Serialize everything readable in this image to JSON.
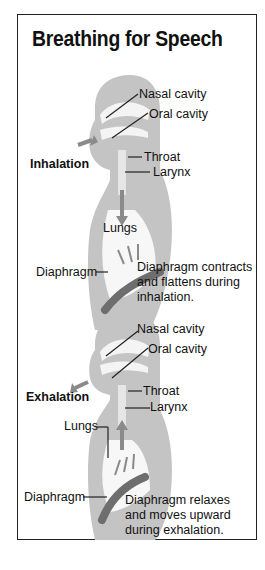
{
  "title": "Breathing for Speech",
  "colors": {
    "body": "#c4c4c4",
    "cavity": "#f4f4f4",
    "diaphragm": "#6e6e6e",
    "arrow": "#8a8a8a",
    "border": "#222222"
  },
  "inhalation": {
    "phase_label": "Inhalation",
    "labels": {
      "nasal": "Nasal cavity",
      "oral": "Oral cavity",
      "throat": "Throat",
      "larynx": "Larynx",
      "lungs": "Lungs",
      "diaphragm": "Diaphragm"
    },
    "caption": "Diaphragm contracts and flattens during inhalation."
  },
  "exhalation": {
    "phase_label": "Exhalation",
    "labels": {
      "nasal": "Nasal cavity",
      "oral": "Oral cavity",
      "throat": "Throat",
      "larynx": "Larynx",
      "lungs": "Lungs",
      "diaphragm": "Diaphragm"
    },
    "caption": "Diaphragm relaxes and moves upward during exhalation."
  }
}
